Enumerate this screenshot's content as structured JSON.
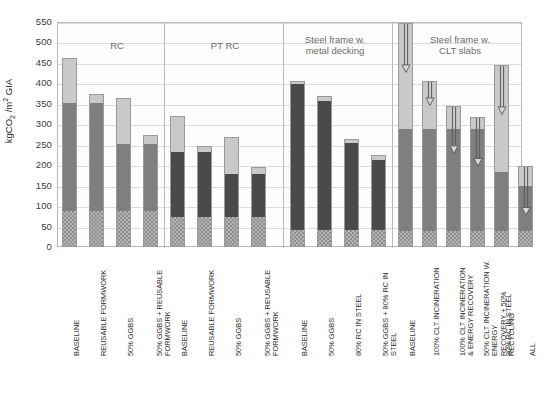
{
  "axis": {
    "y_title": "kgCO2/m2 GIA",
    "y_title_main": "kgCO",
    "y_title_sub": "2",
    "y_title_rest": " /m",
    "y_title_sup": "2",
    "y_title_tail": " GIA",
    "y_ticks": [
      "550",
      "500",
      "450",
      "400",
      "350",
      "300",
      "250",
      "200",
      "150",
      "100",
      "50",
      "0"
    ]
  },
  "groups": [
    {
      "label": "RC"
    },
    {
      "label": "PT RC"
    },
    {
      "label": "Steel frame w.\nmetal decking"
    },
    {
      "label": "Steel frame w.\nCLT slabs"
    }
  ],
  "colors": {
    "hatch": "#b4b4b4",
    "mid_dark": "#4a4a4a",
    "mid_gray": "#7f7f7f",
    "top_light": "#c9c9c9",
    "outline": "#9a9a9a",
    "grid": "#dcdcdc",
    "group_label": "#6c6c6c"
  },
  "chart_data": {
    "type": "bar",
    "title": "",
    "subtitle": "",
    "xlabel": "",
    "ylabel": "kgCO2/m2 GIA",
    "ylim": [
      0,
      550
    ],
    "ytick_step": 50,
    "grid": true,
    "legend": null,
    "stacked": true,
    "series": [
      {
        "name": "substructure (hatched)",
        "style": "hatched-gray"
      },
      {
        "name": "superstructure frame",
        "style": "solid-gray-or-dark"
      },
      {
        "name": "additional / upper",
        "style": "light-gray"
      }
    ],
    "groups": [
      {
        "name": "RC",
        "bars": [
          {
            "category": "BASELINE",
            "hatch": 88,
            "mid": 351,
            "total": 463,
            "mid_tone": "gray",
            "arrow": null
          },
          {
            "category": "REUSABLE FORMWORK",
            "hatch": 88,
            "mid": 351,
            "total": 373,
            "mid_tone": "gray",
            "arrow": null
          },
          {
            "category": "50% GGBS",
            "hatch": 88,
            "mid": 251,
            "total": 364,
            "mid_tone": "gray",
            "arrow": null
          },
          {
            "category": "50% GGBS + REUSABLE\nFORMWORK",
            "hatch": 88,
            "mid": 251,
            "total": 274,
            "mid_tone": "gray",
            "arrow": null
          }
        ]
      },
      {
        "name": "PT RC",
        "bars": [
          {
            "category": "BASELINE",
            "hatch": 74,
            "mid": 231,
            "total": 321,
            "mid_tone": "dark",
            "arrow": null
          },
          {
            "category": "REUSABLE FORMWORK",
            "hatch": 74,
            "mid": 231,
            "total": 248,
            "mid_tone": "dark",
            "arrow": null
          },
          {
            "category": "50% GGBS",
            "hatch": 74,
            "mid": 179,
            "total": 268,
            "mid_tone": "dark",
            "arrow": null
          },
          {
            "category": "50% GGBS + REUSABLE\nFORMWORK",
            "hatch": 74,
            "mid": 179,
            "total": 196,
            "mid_tone": "dark",
            "arrow": null
          }
        ]
      },
      {
        "name": "Steel frame w. metal decking",
        "bars": [
          {
            "category": "BASELINE",
            "hatch": 42,
            "mid": 399,
            "total": 406,
            "mid_tone": "dark",
            "arrow": null
          },
          {
            "category": "50% GGBS",
            "hatch": 42,
            "mid": 358,
            "total": 370,
            "mid_tone": "dark",
            "arrow": null
          },
          {
            "category": "80% RC IN STEEL",
            "hatch": 42,
            "mid": 254,
            "total": 264,
            "mid_tone": "dark",
            "arrow": null
          },
          {
            "category": "50% GGBS + 80% RC IN STEEL",
            "hatch": 42,
            "mid": 213,
            "total": 225,
            "mid_tone": "dark",
            "arrow": null
          }
        ]
      },
      {
        "name": "Steel frame w. CLT slabs",
        "bars": [
          {
            "category": "BASELINE",
            "hatch": 38,
            "mid": 288,
            "total": 547,
            "mid_tone": "gray",
            "arrow": {
              "from": 547,
              "to": 425
            }
          },
          {
            "category": "100% CLT INCINERATION",
            "hatch": 38,
            "mid": 288,
            "total": 406,
            "mid_tone": "gray",
            "arrow": {
              "from": 406,
              "to": 345
            }
          },
          {
            "category": "100% CLT INCINERATION\n& ENERGY RECOVERY",
            "hatch": 38,
            "mid": 288,
            "total": 345,
            "mid_tone": "gray",
            "arrow": {
              "from": 345,
              "to": 228
            }
          },
          {
            "category": "50% CLT INCINERATION W. ENERGY\nRECOVERY + 50% RECYCLING",
            "hatch": 38,
            "mid": 288,
            "total": 317,
            "mid_tone": "gray",
            "arrow": {
              "from": 317,
              "to": 196
            }
          },
          {
            "category": "80% RC IN STEEL",
            "hatch": 38,
            "mid": 184,
            "total": 444,
            "mid_tone": "gray",
            "arrow": {
              "from": 444,
              "to": 322
            }
          },
          {
            "category": "ALL",
            "hatch": 38,
            "mid": 150,
            "total": 199,
            "mid_tone": "gray",
            "arrow": {
              "from": 199,
              "to": 78
            }
          }
        ]
      }
    ]
  }
}
